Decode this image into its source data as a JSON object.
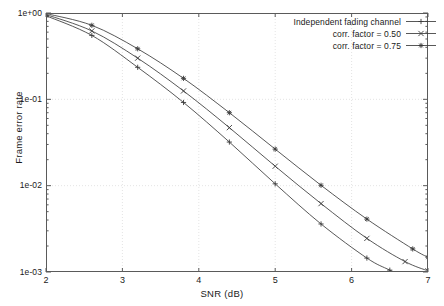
{
  "chart_data": {
    "type": "line",
    "title": "",
    "xlabel": "SNR (dB)",
    "ylabel": "Frame error rate",
    "xlim": [
      2,
      7
    ],
    "ylim": [
      0.001,
      1.0
    ],
    "yscale": "log",
    "grid": true,
    "legend_position": "top-right",
    "xticks": [
      2,
      3,
      4,
      5,
      6,
      7
    ],
    "xtick_labels": [
      "2",
      "3",
      "4",
      "5",
      "6",
      "7"
    ],
    "yticks": [
      1.0,
      0.1,
      0.01,
      0.001
    ],
    "ytick_labels": [
      "1e+00",
      "1e-01",
      "1e-02",
      "1e-03"
    ],
    "series": [
      {
        "name": "Independent fading channel",
        "marker": "plus",
        "color": "#3a3a3a",
        "x": [
          2.0,
          2.6,
          3.2,
          3.8,
          4.4,
          5.0,
          5.6,
          6.2,
          6.5,
          6.8
        ],
        "y": [
          0.93,
          0.55,
          0.235,
          0.092,
          0.032,
          0.0105,
          0.0036,
          0.00145,
          0.00105,
          0.00078
        ]
      },
      {
        "name": "corr. factor = 0.50",
        "marker": "cross",
        "color": "#3a3a3a",
        "x": [
          2.0,
          2.6,
          3.2,
          3.8,
          4.4,
          5.0,
          5.6,
          6.2,
          6.7,
          7.0
        ],
        "y": [
          0.96,
          0.62,
          0.3,
          0.125,
          0.047,
          0.0168,
          0.0062,
          0.00245,
          0.00132,
          0.00103
        ]
      },
      {
        "name": "corr. factor = 0.75",
        "marker": "star",
        "color": "#3a3a3a",
        "x": [
          2.0,
          2.6,
          3.2,
          3.8,
          4.4,
          5.0,
          5.6,
          6.2,
          6.8,
          7.0
        ],
        "y": [
          0.985,
          0.72,
          0.385,
          0.175,
          0.07,
          0.0265,
          0.0101,
          0.0041,
          0.00185,
          0.00148
        ]
      }
    ]
  },
  "legend": {
    "items": [
      {
        "label": "Independent fading channel",
        "marker": "plus"
      },
      {
        "label": "corr. factor = 0.50",
        "marker": "cross"
      },
      {
        "label": "corr. factor = 0.75",
        "marker": "star"
      }
    ]
  }
}
